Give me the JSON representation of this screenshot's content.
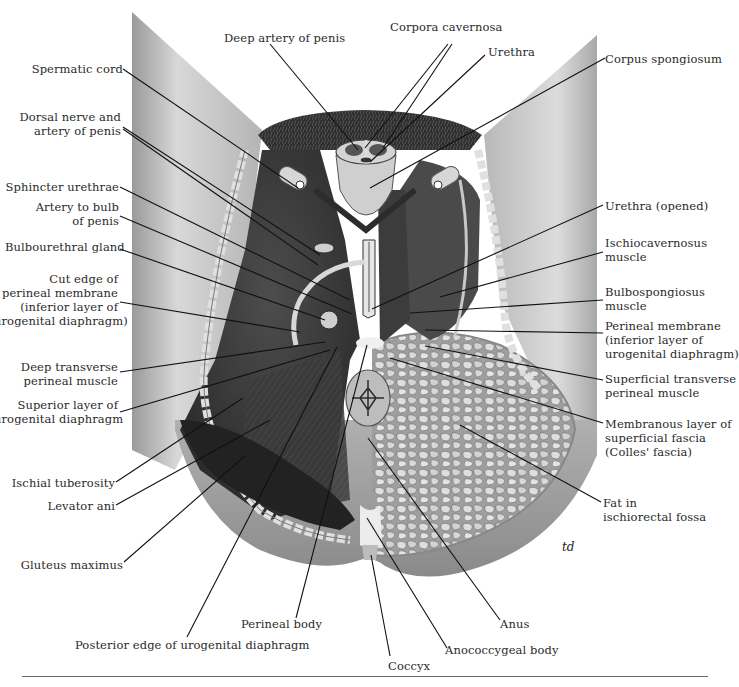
{
  "figure": {
    "signature": "td",
    "colors": {
      "skin_light": "#d6d6d6",
      "skin_mid": "#a9a9a9",
      "skin_dark": "#7a7a7a",
      "muscle_dark": "#3a3a3a",
      "muscle_mid": "#5a5a5a",
      "fat": "#c8c8c8",
      "hair": "#2b2b2b",
      "line": "#111111",
      "text": "#2a2a2a"
    }
  },
  "labels": {
    "left": [
      {
        "id": "spermatic-cord",
        "text": "Spermatic cord",
        "x": 20,
        "y": 62,
        "w": 103
      },
      {
        "id": "dorsal-nerve-artery",
        "text": "Dorsal nerve and\nartery of penis",
        "x": 10,
        "y": 110,
        "w": 111
      },
      {
        "id": "sphincter-urethrae",
        "text": "Sphincter urethrae",
        "x": 5,
        "y": 180,
        "w": 114
      },
      {
        "id": "artery-bulb",
        "text": "Artery to bulb\nof penis",
        "x": 20,
        "y": 200,
        "w": 99
      },
      {
        "id": "bulbourethral-gland",
        "text": "Bulbourethral gland",
        "x": 5,
        "y": 240,
        "w": 114
      },
      {
        "id": "cut-edge-perineal-membrane",
        "text": "Cut edge of\nperineal membrane\n(inferior layer of\nurogenital diaphragm)",
        "x": -6,
        "y": 272,
        "w": 124
      },
      {
        "id": "deep-transverse-perineal",
        "text": "Deep transverse\nperineal muscle",
        "x": 10,
        "y": 360,
        "w": 108
      },
      {
        "id": "superior-layer-ugd",
        "text": "Superior layer of\nurogenital diaphragm",
        "x": -6,
        "y": 398,
        "w": 124
      },
      {
        "id": "ischial-tuberosity",
        "text": "Ischial tuberosity",
        "x": 10,
        "y": 476,
        "w": 105
      },
      {
        "id": "levator-ani",
        "text": "Levator ani",
        "x": 20,
        "y": 499,
        "w": 95
      },
      {
        "id": "gluteus-maximus",
        "text": "Gluteus maximus",
        "x": 10,
        "y": 558,
        "w": 113
      }
    ],
    "top": [
      {
        "id": "deep-artery-penis",
        "text": "Deep artery of penis",
        "x": 224,
        "y": 31
      },
      {
        "id": "corpora-cavernosa",
        "text": "Corpora cavernosa",
        "x": 390,
        "y": 20
      },
      {
        "id": "urethra",
        "text": "Urethra",
        "x": 488,
        "y": 45
      }
    ],
    "right": [
      {
        "id": "corpus-spongiosum",
        "text": "Corpus spongiosum",
        "x": 605,
        "y": 52
      },
      {
        "id": "urethra-opened",
        "text": "Urethra (opened)",
        "x": 605,
        "y": 199
      },
      {
        "id": "ischiocavernosus",
        "text": "Ischiocavernosus\nmuscle",
        "x": 605,
        "y": 236
      },
      {
        "id": "bulbospongiosus",
        "text": "Bulbospongiosus\nmuscle",
        "x": 605,
        "y": 285
      },
      {
        "id": "perineal-membrane",
        "text": "Perineal membrane\n(inferior layer of\nurogenital diaphragm)",
        "x": 605,
        "y": 319
      },
      {
        "id": "superficial-transverse-perineal",
        "text": "Superficial transverse\nperineal muscle",
        "x": 605,
        "y": 372
      },
      {
        "id": "colles-fascia",
        "text": "Membranous layer of\nsuperficial fascia\n(Colles' fascia)",
        "x": 605,
        "y": 417
      },
      {
        "id": "fat-ischiorectal",
        "text": "Fat in\nischiorectal fossa",
        "x": 603,
        "y": 496
      }
    ],
    "bottom": [
      {
        "id": "perineal-body",
        "text": "Perineal body",
        "x": 241,
        "y": 617
      },
      {
        "id": "posterior-edge-ugd",
        "text": "Posterior edge of urogenital diaphragm",
        "x": 75,
        "y": 638
      },
      {
        "id": "coccyx",
        "text": "Coccyx",
        "x": 388,
        "y": 659
      },
      {
        "id": "anococcygeal-body",
        "text": "Anococcygeal body",
        "x": 445,
        "y": 643
      },
      {
        "id": "anus",
        "text": "Anus",
        "x": 500,
        "y": 617
      }
    ]
  },
  "leaders": [
    {
      "id": "spermatic-cord",
      "x1": 123,
      "y1": 69,
      "x2": 298,
      "y2": 188
    },
    {
      "id": "dorsal-nerve-artery-1",
      "x1": 123,
      "y1": 127,
      "x2": 320,
      "y2": 255
    },
    {
      "id": "dorsal-nerve-artery-2",
      "x1": 123,
      "y1": 129,
      "x2": 318,
      "y2": 265
    },
    {
      "id": "sphincter-urethrae",
      "x1": 120,
      "y1": 187,
      "x2": 350,
      "y2": 300
    },
    {
      "id": "artery-bulb",
      "x1": 120,
      "y1": 216,
      "x2": 352,
      "y2": 314
    },
    {
      "id": "bulbourethral-gland",
      "x1": 120,
      "y1": 249,
      "x2": 325,
      "y2": 320
    },
    {
      "id": "cut-edge-perineal-membrane",
      "x1": 120,
      "y1": 302,
      "x2": 300,
      "y2": 332
    },
    {
      "id": "deep-transverse-perineal",
      "x1": 120,
      "y1": 372,
      "x2": 325,
      "y2": 342
    },
    {
      "id": "superior-layer-ugd",
      "x1": 120,
      "y1": 412,
      "x2": 330,
      "y2": 350
    },
    {
      "id": "ischial-tuberosity",
      "x1": 116,
      "y1": 482,
      "x2": 243,
      "y2": 398
    },
    {
      "id": "levator-ani",
      "x1": 116,
      "y1": 505,
      "x2": 270,
      "y2": 420
    },
    {
      "id": "gluteus-maximus",
      "x1": 124,
      "y1": 562,
      "x2": 245,
      "y2": 456
    },
    {
      "id": "deep-artery-penis",
      "x1": 270,
      "y1": 44,
      "x2": 358,
      "y2": 150
    },
    {
      "id": "corpora-cavernosa-1",
      "x1": 448,
      "y1": 44,
      "x2": 365,
      "y2": 148
    },
    {
      "id": "corpora-cavernosa-2",
      "x1": 452,
      "y1": 44,
      "x2": 383,
      "y2": 148
    },
    {
      "id": "urethra",
      "x1": 485,
      "y1": 55,
      "x2": 370,
      "y2": 162
    },
    {
      "id": "corpus-spongiosum",
      "x1": 605,
      "y1": 58,
      "x2": 370,
      "y2": 188
    },
    {
      "id": "urethra-opened",
      "x1": 603,
      "y1": 205,
      "x2": 372,
      "y2": 309
    },
    {
      "id": "ischiocavernosus",
      "x1": 603,
      "y1": 252,
      "x2": 440,
      "y2": 297
    },
    {
      "id": "bulbospongiosus",
      "x1": 603,
      "y1": 300,
      "x2": 410,
      "y2": 313
    },
    {
      "id": "perineal-membrane",
      "x1": 603,
      "y1": 333,
      "x2": 425,
      "y2": 330
    },
    {
      "id": "superficial-transverse-perineal",
      "x1": 603,
      "y1": 380,
      "x2": 425,
      "y2": 346
    },
    {
      "id": "colles-fascia",
      "x1": 603,
      "y1": 423,
      "x2": 390,
      "y2": 358
    },
    {
      "id": "fat-ischiorectal",
      "x1": 601,
      "y1": 502,
      "x2": 460,
      "y2": 425
    },
    {
      "id": "perineal-body",
      "x1": 296,
      "y1": 618,
      "x2": 367,
      "y2": 345
    },
    {
      "id": "posterior-edge-ugd",
      "x1": 187,
      "y1": 637,
      "x2": 337,
      "y2": 347
    },
    {
      "id": "coccyx",
      "x1": 390,
      "y1": 656,
      "x2": 371,
      "y2": 555
    },
    {
      "id": "anococcygeal-body",
      "x1": 447,
      "y1": 648,
      "x2": 367,
      "y2": 518
    },
    {
      "id": "anus",
      "x1": 500,
      "y1": 620,
      "x2": 368,
      "y2": 438
    }
  ]
}
